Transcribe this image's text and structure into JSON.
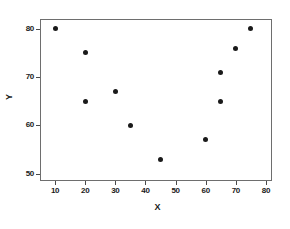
{
  "chart_data": {
    "type": "scatter",
    "title": "",
    "xlabel": "X",
    "ylabel": "Y",
    "xlim": [
      5,
      82
    ],
    "ylim": [
      48.5,
      82
    ],
    "xticks": [
      10,
      20,
      30,
      40,
      50,
      60,
      70,
      80
    ],
    "xtick_labels": [
      "10",
      "20",
      "30",
      "40",
      "50",
      "60",
      "70",
      "80"
    ],
    "yticks": [
      50,
      60,
      70,
      80
    ],
    "ytick_labels": [
      "50",
      "60",
      "70",
      "80"
    ],
    "grid": false,
    "legend": false,
    "marker": "filled-circle",
    "marker_color": "#1a1a1a",
    "frame_color": "#6e6e6e",
    "background_color": "#ffffff",
    "points": [
      {
        "x": 10,
        "y": 80
      },
      {
        "x": 20,
        "y": 75
      },
      {
        "x": 20,
        "y": 65
      },
      {
        "x": 30,
        "y": 67
      },
      {
        "x": 35,
        "y": 60
      },
      {
        "x": 45,
        "y": 53
      },
      {
        "x": 60,
        "y": 57
      },
      {
        "x": 65,
        "y": 65
      },
      {
        "x": 65,
        "y": 71
      },
      {
        "x": 70,
        "y": 76
      },
      {
        "x": 75,
        "y": 80
      }
    ]
  }
}
